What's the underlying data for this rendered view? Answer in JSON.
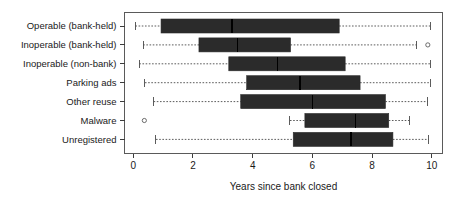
{
  "chart_data": {
    "type": "boxplot",
    "title": "",
    "xlabel": "Years since bank closed",
    "ylabel": "",
    "xlim": [
      0,
      10
    ],
    "xticks": [
      0,
      2,
      4,
      6,
      8,
      10
    ],
    "xticklabels": [
      "0",
      "2",
      "4",
      "6",
      "8",
      "10"
    ],
    "grid": false,
    "orientation": "horizontal",
    "categories": [
      "Operable (bank-held)",
      "Inoperable (bank-held)",
      "Inoperable (non-bank)",
      "Parking ads",
      "Other reuse",
      "Malware",
      "Unregistered"
    ],
    "boxes": [
      {
        "category": "Operable (bank-held)",
        "whisker_low": 0.07,
        "q1": 0.93,
        "median": 3.31,
        "q3": 6.9,
        "whisker_high": 9.95,
        "outliers": []
      },
      {
        "category": "Inoperable (bank-held)",
        "whisker_low": 0.33,
        "q1": 2.2,
        "median": 3.49,
        "q3": 5.27,
        "whisker_high": 9.5,
        "outliers": [
          9.87
        ]
      },
      {
        "category": "Inoperable (non-bank)",
        "whisker_low": 0.2,
        "q1": 3.2,
        "median": 4.83,
        "q3": 7.1,
        "whisker_high": 9.95,
        "outliers": []
      },
      {
        "category": "Parking ads",
        "whisker_low": 0.39,
        "q1": 3.8,
        "median": 5.58,
        "q3": 7.6,
        "whisker_high": 9.95,
        "outliers": []
      },
      {
        "category": "Other reuse",
        "whisker_low": 0.68,
        "q1": 3.6,
        "median": 6.0,
        "q3": 8.45,
        "whisker_high": 9.87,
        "outliers": []
      },
      {
        "category": "Malware",
        "whisker_low": 5.25,
        "q1": 5.75,
        "median": 7.45,
        "q3": 8.56,
        "whisker_high": 9.26,
        "outliers": [
          0.37
        ]
      },
      {
        "category": "Unregistered",
        "whisker_low": 0.76,
        "q1": 5.36,
        "median": 7.3,
        "q3": 8.7,
        "whisker_high": 9.9,
        "outliers": []
      }
    ],
    "colors": {
      "box_fill": "#2b2b2b",
      "median": "#000000",
      "whisker": "#4a4a4a",
      "axis": "#3c3c3c",
      "text": "#1a1a1a",
      "background": "#ffffff"
    }
  }
}
